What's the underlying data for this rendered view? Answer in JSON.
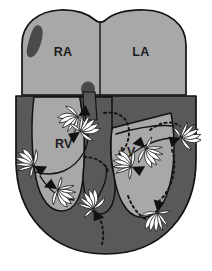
{
  "figure": {
    "type": "anatomical-diagram",
    "orientation": "anterior four-chamber view",
    "background_color": "#ffffff"
  },
  "palette": {
    "myocardium": "#595959",
    "chamber_fill": "#a8a8a8",
    "septum": "#595959",
    "outline": "#121212",
    "vortex_blade": "#ffffff",
    "arrow_head": "#111111",
    "blob_marker": "#4a4a4a",
    "label_color": "#1c1c1c"
  },
  "chambers": [
    {
      "id": "RA",
      "label": "RA",
      "name": "right-atrium",
      "x": 63,
      "y": 52,
      "fill": "#a8a8a8"
    },
    {
      "id": "LA",
      "label": "LA",
      "name": "left-atrium",
      "x": 141,
      "y": 52,
      "fill": "#a8a8a8"
    },
    {
      "id": "RV",
      "label": "RV",
      "name": "right-ventricle",
      "x": 67,
      "y": 143,
      "fill": "#a8a8a8"
    },
    {
      "id": "LV",
      "label": "LV",
      "name": "left-ventricle",
      "x": 130,
      "y": 151,
      "fill": "#a8a8a8"
    }
  ],
  "markers": [
    {
      "name": "atrial-appendage-blob",
      "shape": "comma",
      "cx": 34,
      "cy": 42,
      "fill": "#4a4a4a"
    },
    {
      "name": "av-node-blob",
      "shape": "oval",
      "cx": 88,
      "cy": 90,
      "rx": 7,
      "ry": 7.5,
      "fill": "#4a4a4a"
    }
  ],
  "vortices": [
    {
      "name": "vortex-rv-outflow-upper",
      "cx": 78,
      "cy": 117,
      "r": 13,
      "rotation": -35,
      "direction": "clockwise"
    },
    {
      "name": "vortex-rv-inflow",
      "cx": 80,
      "cy": 131,
      "r": 12,
      "rotation": 140,
      "direction": "counter-clockwise"
    },
    {
      "name": "vortex-rv-lateral-wall",
      "cx": 33,
      "cy": 166,
      "r": 12,
      "rotation": 25,
      "direction": "clockwise"
    },
    {
      "name": "vortex-rv-mid",
      "cx": 58,
      "cy": 189,
      "r": 12,
      "rotation": -150,
      "direction": "counter-clockwise"
    },
    {
      "name": "vortex-apex-septal",
      "cx": 93,
      "cy": 209,
      "r": 14,
      "rotation": 60,
      "direction": "clockwise"
    },
    {
      "name": "vortex-lv-inflow",
      "cx": 146,
      "cy": 148,
      "r": 12,
      "rotation": -140,
      "direction": "counter-clockwise"
    },
    {
      "name": "vortex-lv-outflow",
      "cx": 131,
      "cy": 167,
      "r": 12,
      "rotation": 20,
      "direction": "clockwise"
    },
    {
      "name": "vortex-lv-lateral-wall",
      "cx": 181,
      "cy": 137,
      "r": 12,
      "rotation": 155,
      "direction": "counter-clockwise"
    },
    {
      "name": "vortex-lv-apex",
      "cx": 158,
      "cy": 213,
      "r": 13,
      "rotation": -85,
      "direction": "clockwise"
    }
  ],
  "flow_paths": [
    {
      "name": "flow-dashed-la-to-lv",
      "style": "dashed"
    },
    {
      "name": "flow-dashed-lv-lateral",
      "style": "dashed"
    },
    {
      "name": "flow-dashed-apex-return",
      "style": "dashed"
    },
    {
      "name": "flow-dashed-lv-apex-loop",
      "style": "dashed"
    },
    {
      "name": "flow-dashed-rv-septal",
      "style": "dashed"
    },
    {
      "name": "flow-solid-rv-loop",
      "style": "solid"
    },
    {
      "name": "flow-solid-lv-loop",
      "style": "solid"
    }
  ]
}
